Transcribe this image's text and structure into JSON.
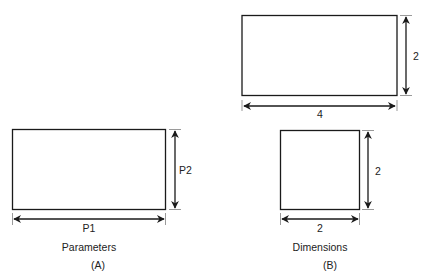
{
  "panel_a": {
    "caption": "Parameters",
    "tag": "(A)",
    "width_label": "P1",
    "height_label": "P2"
  },
  "panel_b": {
    "caption": "Dimensions",
    "tag": "(B)",
    "rect_top": {
      "width_label": "4",
      "height_label": "2"
    },
    "rect_bottom": {
      "width_label": "2",
      "height_label": "2"
    }
  },
  "colors": {
    "stroke": "#1a1a1a",
    "text": "#222222",
    "background": "#ffffff"
  }
}
